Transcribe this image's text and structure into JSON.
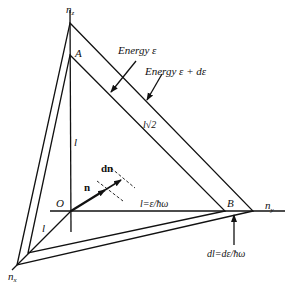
{
  "diagram": {
    "axes": {
      "nz_label": "n",
      "nz_sub": "z",
      "ny_label": "n",
      "ny_sub": "y",
      "nx_label": "n",
      "nx_sub": "x",
      "origin_label": "O"
    },
    "vertices": {
      "A": "A",
      "B": "B"
    },
    "labels": {
      "energy_inner": "Energy  ε",
      "energy_outer": "Energy  ε + dε",
      "hypotenuse": "l√2",
      "vertical_l": "l",
      "diagonal_l": "l",
      "horizontal_l": "l=ε/ħω",
      "vector_n": "n",
      "vector_dn": "dn",
      "dl": "dl=dε/ħω"
    }
  }
}
